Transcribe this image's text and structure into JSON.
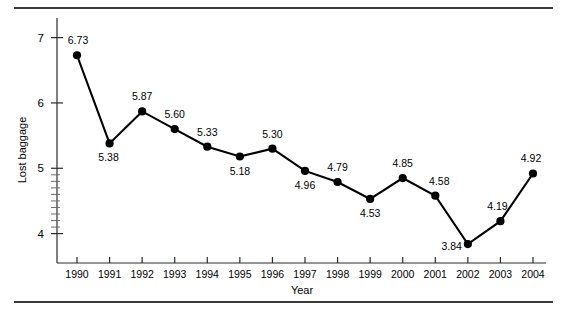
{
  "chart_data": {
    "type": "line",
    "title": "",
    "xlabel": "Year",
    "ylabel": "Lost baggage",
    "categories": [
      "1990",
      "1991",
      "1992",
      "1993",
      "1994",
      "1995",
      "1996",
      "1997",
      "1998",
      "1999",
      "2000",
      "2001",
      "2002",
      "2003",
      "2004"
    ],
    "values": [
      6.73,
      5.38,
      5.87,
      5.6,
      5.33,
      5.18,
      5.3,
      4.96,
      4.79,
      4.53,
      4.85,
      4.58,
      3.84,
      4.19,
      4.92
    ],
    "point_labels": [
      "6.73",
      "5.38",
      "5.87",
      "5.60",
      "5.33",
      "5.18",
      "5.30",
      "4.96",
      "4.79",
      "4.53",
      "4.85",
      "4.58",
      "3.84",
      "4.19",
      "4.92"
    ],
    "label_positions": [
      "above",
      "below",
      "above",
      "above",
      "above",
      "below",
      "above",
      "below",
      "above",
      "below",
      "above",
      "above",
      "below",
      "above",
      "above"
    ],
    "ytick_labels": [
      "4",
      "5",
      "6",
      "7"
    ],
    "ytick_values": [
      4,
      5,
      6,
      7
    ],
    "xtick_labels": [
      "1990",
      "1991",
      "1992",
      "1993",
      "1994",
      "1995",
      "1996",
      "1997",
      "1998",
      "1999",
      "2000",
      "2001",
      "2002",
      "2003",
      "2004"
    ],
    "ylim": [
      3.55,
      7.3
    ],
    "xlim": [
      1989.4,
      2004.6
    ],
    "grid": false,
    "legend": null,
    "marker": "filled-circle",
    "line_color": "#000000",
    "marker_color": "#000000",
    "axis_color": "#2b2b2b",
    "rule_color": "#3a3a3a",
    "background": "#ffffff"
  },
  "figure": {
    "top_rule": "horizontal-rule",
    "bottom_rule": "horizontal-rule"
  }
}
